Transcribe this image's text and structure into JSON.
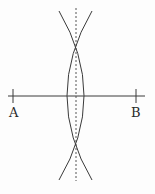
{
  "diagram": {
    "type": "perpendicular-bisector-construction",
    "points": {
      "A": {
        "label": "A",
        "x": 13,
        "y": 96
      },
      "B": {
        "label": "B",
        "x": 136,
        "y": 96
      }
    },
    "segment": {
      "from": "A",
      "to": "B",
      "x1": 8,
      "x2": 145,
      "y": 96
    },
    "bisector": {
      "style": "dashed",
      "x": 76,
      "y1": 8,
      "y2": 181
    },
    "intersections": [
      {
        "x": 76,
        "y": 34
      },
      {
        "x": 76,
        "y": 156
      }
    ],
    "arcs": [
      {
        "center": "B",
        "side": "left"
      },
      {
        "center": "A",
        "side": "right"
      }
    ],
    "colors": {
      "line": "#3a3a3a",
      "background": "#fdfdfd",
      "text": "#2a2a2a"
    }
  }
}
